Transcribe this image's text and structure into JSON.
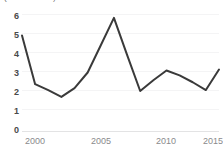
{
  "chart_title": "(in % of GDP)",
  "chart_data": {
    "type": "line",
    "title": "(in % of GDP)",
    "subtitle": "",
    "xlabel": "",
    "ylabel": "",
    "x": [
      2000,
      2001,
      2002,
      2003,
      2004,
      2005,
      2006,
      2007,
      2008,
      2009,
      2010,
      2011,
      2012,
      2013,
      2014,
      2015
    ],
    "series": [
      {
        "name": "series-1",
        "color": "#3a3a3a",
        "values": [
          4.9,
          2.4,
          2.1,
          1.75,
          2.2,
          3.0,
          4.4,
          5.8,
          3.9,
          2.05,
          2.6,
          3.1,
          2.85,
          2.5,
          2.1,
          3.15
        ]
      }
    ],
    "xlim": [
      2000,
      2015
    ],
    "ylim": [
      0,
      6
    ],
    "xticks": [
      2000,
      2005,
      2010,
      2015
    ],
    "xtick_labels": [
      "2000",
      "2005",
      "2010",
      "2015"
    ],
    "yticks": [
      0,
      1,
      2,
      3,
      4,
      5,
      6
    ],
    "ytick_labels": [
      "0",
      "1",
      "2",
      "3",
      "4",
      "5",
      "6"
    ],
    "grid": true,
    "legend": false,
    "legend_position": "none"
  },
  "style": {
    "line_color": "#3a3a3a",
    "grid_color": "#f4f4f5",
    "axis_color": "#e3e3e4",
    "ytick_text_color": "#4a4a4a",
    "xtick_text_color": "#8a8a8c",
    "background": "#ffffff"
  }
}
